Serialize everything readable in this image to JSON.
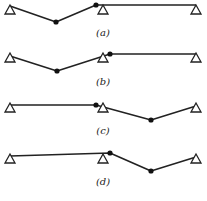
{
  "diagram": {
    "title": "",
    "panels": [
      {
        "label": "(a)",
        "supports": [
          [
            10,
            9
          ],
          [
            103,
            9
          ],
          [
            196,
            9
          ]
        ],
        "beam": [
          [
            10,
            6
          ],
          [
            56,
            22
          ],
          [
            96,
            5
          ],
          [
            196,
            5
          ]
        ],
        "hinges": [
          [
            56,
            22
          ],
          [
            96,
            5
          ]
        ],
        "label_pos": [
          103,
          36
        ]
      },
      {
        "label": "(b)",
        "supports": [
          [
            10,
            57
          ],
          [
            103,
            57
          ],
          [
            196,
            57
          ]
        ],
        "beam": [
          [
            10,
            56
          ],
          [
            57,
            71
          ],
          [
            110,
            54
          ],
          [
            196,
            54
          ]
        ],
        "hinges": [
          [
            57,
            71
          ],
          [
            110,
            54
          ]
        ],
        "label_pos": [
          103,
          85
        ]
      },
      {
        "label": "(c)",
        "supports": [
          [
            10,
            107
          ],
          [
            103,
            107
          ],
          [
            196,
            107
          ]
        ],
        "beam": [
          [
            10,
            105
          ],
          [
            96,
            105
          ],
          [
            151,
            120
          ],
          [
            196,
            106
          ]
        ],
        "hinges": [
          [
            96,
            105
          ],
          [
            151,
            120
          ]
        ],
        "label_pos": [
          103,
          134
        ]
      },
      {
        "label": "(d)",
        "supports": [
          [
            10,
            158
          ],
          [
            103,
            158
          ],
          [
            196,
            158
          ]
        ],
        "beam": [
          [
            10,
            156
          ],
          [
            110,
            153
          ],
          [
            151,
            171
          ],
          [
            196,
            157
          ]
        ],
        "hinges": [
          [
            110,
            153
          ],
          [
            151,
            171
          ]
        ],
        "label_pos": [
          103,
          185
        ]
      }
    ]
  }
}
